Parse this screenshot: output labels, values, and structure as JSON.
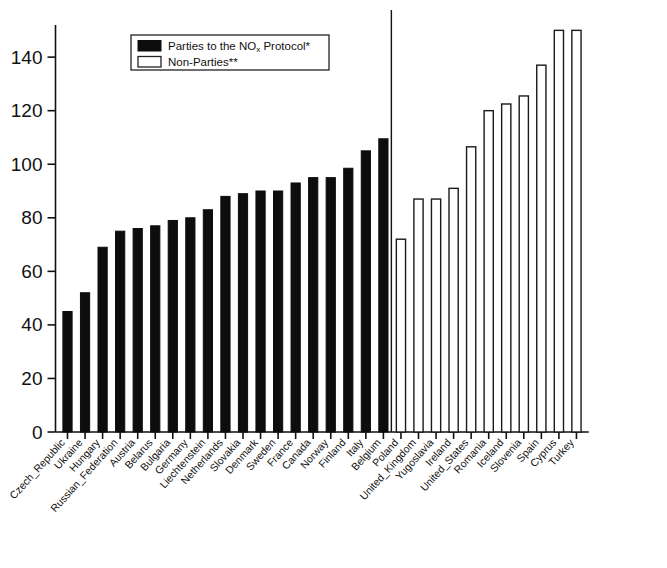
{
  "chart_data": {
    "type": "bar",
    "title": "",
    "subtitle": "",
    "xlabel": "",
    "ylabel": "",
    "ylim": [
      0,
      152
    ],
    "yticks": [
      0,
      20,
      40,
      60,
      80,
      100,
      120,
      140
    ],
    "ytick_labels": [
      "0",
      "20",
      "40",
      "60",
      "80",
      "100",
      "120",
      "140"
    ],
    "grid": false,
    "legend_position": "top-left-inside",
    "legend": [
      {
        "key": "parties",
        "label": "Parties to the NO",
        "label_sub": "x",
        "label_tail": " Protocol*",
        "swatch": "filled-black"
      },
      {
        "key": "non_parties",
        "label": "Non-Parties**",
        "label_sub": "",
        "label_tail": "",
        "swatch": "open-white"
      }
    ],
    "annotations": [
      {
        "name": "group-divider",
        "type": "vertical-line",
        "between": [
          "Belgium",
          "Poland"
        ]
      }
    ],
    "categories": [
      "Czech_Republic",
      "Ukraine",
      "Hungary",
      "Russian_Federation",
      "Austria",
      "Belarus",
      "Bulgaria",
      "Germany",
      "Liechtenstein",
      "Netherlands",
      "Slovakia",
      "Denmark",
      "Sweden",
      "France",
      "Canada",
      "Norway",
      "Finland",
      "Italy",
      "Belgium",
      "Poland",
      "United_Kingdom",
      "Yugoslavia",
      "Ireland",
      "United_States",
      "Romania",
      "Iceland",
      "Slovenia",
      "Spain",
      "Cyprus",
      "Turkey"
    ],
    "values": [
      45,
      52,
      69,
      75,
      76,
      77,
      79,
      80,
      83,
      88,
      89,
      90,
      90,
      93,
      95,
      95,
      98.5,
      105,
      109.5,
      72,
      87,
      87,
      91,
      106.5,
      120,
      122.5,
      125.5,
      137,
      150,
      150
    ],
    "series": [
      {
        "name": "Parties to the NOx Protocol*",
        "group": "parties",
        "style": "filled-black",
        "points": [
          {
            "category": "Czech_Republic",
            "value": 45
          },
          {
            "category": "Ukraine",
            "value": 52
          },
          {
            "category": "Hungary",
            "value": 69
          },
          {
            "category": "Russian_Federation",
            "value": 75
          },
          {
            "category": "Austria",
            "value": 76
          },
          {
            "category": "Belarus",
            "value": 77
          },
          {
            "category": "Bulgaria",
            "value": 79
          },
          {
            "category": "Germany",
            "value": 80
          },
          {
            "category": "Liechtenstein",
            "value": 83
          },
          {
            "category": "Netherlands",
            "value": 88
          },
          {
            "category": "Slovakia",
            "value": 89
          },
          {
            "category": "Denmark",
            "value": 90
          },
          {
            "category": "Sweden",
            "value": 90
          },
          {
            "category": "France",
            "value": 93
          },
          {
            "category": "Canada",
            "value": 95
          },
          {
            "category": "Norway",
            "value": 95
          },
          {
            "category": "Finland",
            "value": 98.5
          },
          {
            "category": "Italy",
            "value": 105
          },
          {
            "category": "Belgium",
            "value": 109.5
          }
        ]
      },
      {
        "name": "Non-Parties**",
        "group": "non_parties",
        "style": "open-white",
        "points": [
          {
            "category": "Poland",
            "value": 72
          },
          {
            "category": "United_Kingdom",
            "value": 87
          },
          {
            "category": "Yugoslavia",
            "value": 87
          },
          {
            "category": "Ireland",
            "value": 91
          },
          {
            "category": "United_States",
            "value": 106.5
          },
          {
            "category": "Romania",
            "value": 120
          },
          {
            "category": "Iceland",
            "value": 122.5
          },
          {
            "category": "Slovenia",
            "value": 125.5
          },
          {
            "category": "Spain",
            "value": 137
          },
          {
            "category": "Cyprus",
            "value": 150
          },
          {
            "category": "Turkey",
            "value": 150
          }
        ]
      }
    ],
    "colors": {
      "parties": "#0d0d0d",
      "non_parties": "#ffffff",
      "non_parties_stroke": "#1a1a1a",
      "axis": "#111111",
      "background": "#ffffff"
    }
  }
}
